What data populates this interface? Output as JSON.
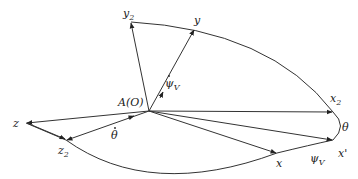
{
  "diagram": {
    "origin_label": "A(O)",
    "axes": {
      "y2": {
        "label": "y",
        "sub": "2"
      },
      "y": {
        "label": "y"
      },
      "x2": {
        "label": "x",
        "sub": "2"
      },
      "x_prime": {
        "label": "x'"
      },
      "x": {
        "label": "x"
      },
      "z": {
        "label": "z"
      },
      "z2": {
        "label": "z",
        "sub": "2"
      }
    },
    "angles": {
      "theta": "θ",
      "psi_v": {
        "label": "ψ",
        "sub": "V"
      },
      "theta_dot": "θ",
      "psi_v_dot": {
        "label": "ψ",
        "sub": "V"
      }
    },
    "colors": {
      "stroke": "#333333",
      "text": "#222222",
      "background": "#ffffff"
    }
  }
}
